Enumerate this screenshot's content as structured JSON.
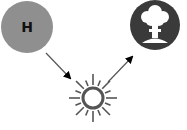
{
  "diagram": {
    "nodes": [
      {
        "id": "hydrogen",
        "label": "H",
        "icon": "hydrogen-atom-icon",
        "color": "#8f8f8f"
      },
      {
        "id": "fusion",
        "label": "",
        "icon": "sun-burst-icon",
        "color": "#555555"
      },
      {
        "id": "explosion",
        "label": "",
        "icon": "mushroom-cloud-icon",
        "color": "#3a3a3a"
      }
    ],
    "edges": [
      {
        "from": "hydrogen",
        "to": "fusion"
      },
      {
        "from": "fusion",
        "to": "explosion"
      }
    ],
    "colors": {
      "arrow": "#444444",
      "arrowhead": "#000000",
      "background": "#ffffff"
    }
  }
}
